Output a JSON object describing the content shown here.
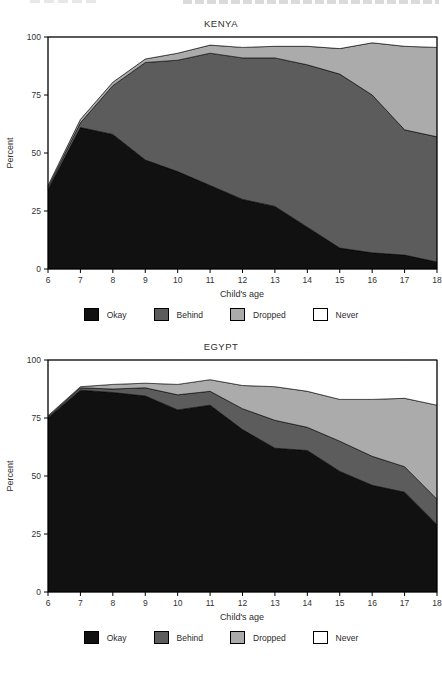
{
  "figure": {
    "xlabel": "Child's age",
    "ylabel": "Percent"
  },
  "chart_data": [
    {
      "type": "area",
      "stacked": true,
      "title": "KENYA",
      "xlabel": "Child's age",
      "ylabel": "Percent",
      "x": [
        6,
        7,
        8,
        9,
        10,
        11,
        12,
        13,
        14,
        15,
        16,
        17,
        18
      ],
      "x_ticks": [
        6,
        7,
        8,
        9,
        10,
        11,
        12,
        13,
        14,
        15,
        16,
        17,
        18
      ],
      "y_ticks": [
        0,
        25,
        50,
        75,
        100
      ],
      "xlim": [
        6,
        18
      ],
      "ylim": [
        0,
        100
      ],
      "grid": false,
      "legend_position": "bottom",
      "series": [
        {
          "name": "Okay",
          "color": "#111111",
          "values": [
            34,
            61,
            58,
            47,
            42,
            36,
            30,
            27,
            18,
            9,
            7,
            6,
            3
          ]
        },
        {
          "name": "Behind",
          "color": "#5c5c5c",
          "values": [
            1,
            2,
            21,
            42,
            48,
            57,
            61,
            64,
            70,
            75,
            68,
            54,
            54
          ]
        },
        {
          "name": "Dropped",
          "color": "#ababab",
          "values": [
            1,
            1.5,
            1.5,
            1.5,
            3,
            3.5,
            4.5,
            5,
            8,
            11,
            22.5,
            36,
            38.5
          ]
        },
        {
          "name": "Never",
          "color": "#ffffff",
          "values": [
            64,
            35.5,
            19.5,
            9.5,
            7,
            3.5,
            4.5,
            4,
            4,
            5,
            2.5,
            4,
            4.5
          ]
        }
      ]
    },
    {
      "type": "area",
      "stacked": true,
      "title": "EGYPT",
      "xlabel": "Child's age",
      "ylabel": "Percent",
      "x": [
        6,
        7,
        8,
        9,
        10,
        11,
        12,
        13,
        14,
        15,
        16,
        17,
        18
      ],
      "x_ticks": [
        6,
        7,
        8,
        9,
        10,
        11,
        12,
        13,
        14,
        15,
        16,
        17,
        18
      ],
      "y_ticks": [
        0,
        25,
        50,
        75,
        100
      ],
      "xlim": [
        6,
        18
      ],
      "ylim": [
        0,
        100
      ],
      "grid": false,
      "legend_position": "bottom",
      "series": [
        {
          "name": "Okay",
          "color": "#111111",
          "values": [
            75,
            87,
            86,
            84.5,
            78.5,
            80.5,
            70,
            62,
            61,
            52,
            46,
            43,
            29
          ]
        },
        {
          "name": "Behind",
          "color": "#5c5c5c",
          "values": [
            0.5,
            1,
            1.5,
            3.5,
            6.5,
            6,
            9,
            12,
            10,
            13,
            12.5,
            11,
            11
          ]
        },
        {
          "name": "Dropped",
          "color": "#ababab",
          "values": [
            0.5,
            0.5,
            2,
            2,
            4.5,
            5,
            10,
            14.5,
            15.5,
            18,
            24.5,
            29.5,
            40.5
          ]
        },
        {
          "name": "Never",
          "color": "#ffffff",
          "values": [
            24,
            11.5,
            10.5,
            10,
            10.5,
            8.5,
            11,
            11.5,
            13.5,
            17,
            17,
            16.5,
            19.5
          ]
        }
      ]
    }
  ]
}
